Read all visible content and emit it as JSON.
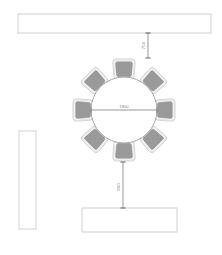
{
  "drawing": {
    "title": "Round Table Seating Plan",
    "units": "mm",
    "background_color": "#ffffff",
    "line_color": "#bfbfbf",
    "chair_fill_color": "#9a9a9a",
    "chair_outline_color": "#c9c9c9",
    "table_fill_color": "#ffffff",
    "table_outline_color": "#a8a8a8",
    "dimension_color": "#8a8a8a"
  },
  "elements": {
    "top_counter": {
      "name": "top-counter",
      "label": "",
      "x": 18,
      "y": 14,
      "width": 193,
      "height": 19
    },
    "left_counter": {
      "name": "left-counter",
      "label": "",
      "x": 19,
      "y": 131,
      "width": 17,
      "height": 98
    },
    "bottom_counter": {
      "name": "bottom-counter",
      "label": "",
      "x": 82,
      "y": 208,
      "width": 95,
      "height": 24
    },
    "round_table": {
      "name": "round-table",
      "center_x": 124,
      "center_y": 110,
      "radius": 33,
      "seats": 8
    }
  },
  "dimensions": {
    "table_diameter": {
      "value": "1800",
      "orientation": "horizontal"
    },
    "clearance_top": {
      "value": "750",
      "orientation": "vertical"
    },
    "clearance_bottom": {
      "value": "800",
      "orientation": "vertical"
    }
  },
  "chairs": [
    {
      "id": "chair-1",
      "angle": -90,
      "seat_position": "north"
    },
    {
      "id": "chair-2",
      "angle": -45,
      "seat_position": "north-east"
    },
    {
      "id": "chair-3",
      "angle": 0,
      "seat_position": "east"
    },
    {
      "id": "chair-4",
      "angle": 45,
      "seat_position": "south-east"
    },
    {
      "id": "chair-5",
      "angle": 90,
      "seat_position": "south"
    },
    {
      "id": "chair-6",
      "angle": 135,
      "seat_position": "south-west"
    },
    {
      "id": "chair-7",
      "angle": 180,
      "seat_position": "west"
    },
    {
      "id": "chair-8",
      "angle": -135,
      "seat_position": "north-west"
    }
  ]
}
